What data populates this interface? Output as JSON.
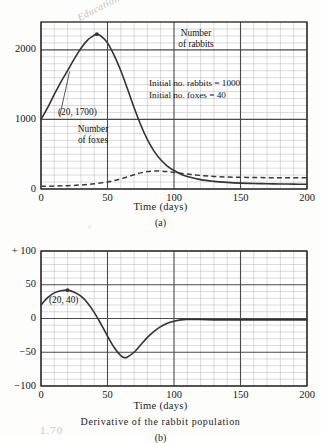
{
  "scan_artifacts": {
    "top_note": "Education",
    "mid_note": "e",
    "bottom_note": "1.70"
  },
  "figures": [
    {
      "id": "figure-a",
      "panel_label": "(a)",
      "caption": "",
      "axis_title": "Time  (days)",
      "annotations": [
        {
          "name": "rabbits-label",
          "text": "Number\nof rabbits"
        },
        {
          "name": "foxes-label",
          "text": "Number\nof foxes"
        },
        {
          "name": "initial-conditions",
          "text": "Initial  no.  rabbits  =  1000\nInitial  no.  foxes  =  40"
        },
        {
          "name": "peak-point-label",
          "text": "(20, 1700)"
        }
      ]
    },
    {
      "id": "figure-b",
      "panel_label": "(b)",
      "caption": "Derivative  of  the  rabbit  population",
      "axis_title": "Time  (days)",
      "annotations": [
        {
          "name": "point-label",
          "text": "(20, 40)"
        }
      ]
    }
  ],
  "chart_data": [
    {
      "type": "line",
      "id": "rabbit-fox-populations",
      "title": "",
      "xlabel": "Time  (days)",
      "ylabel": "",
      "xlim": [
        0,
        200
      ],
      "ylim": [
        0,
        2400
      ],
      "xticks": [
        0,
        50,
        100,
        150,
        200
      ],
      "xtick_labels": [
        "0",
        "50",
        "100",
        "150",
        "200"
      ],
      "yticks": [
        0,
        1000,
        2000
      ],
      "ytick_labels": [
        "0",
        "1000",
        "2000"
      ],
      "grid": "minor 10 days x 100 units, major 50 days x 1000 units",
      "legend": "inline labels",
      "annotations": [
        {
          "text": "(20, 1700)",
          "x": 20,
          "y": 1700
        },
        {
          "text": "Initial no. rabbits = 1000",
          "x": 95,
          "y": 1500
        },
        {
          "text": "Initial no. foxes = 40",
          "x": 95,
          "y": 1350
        }
      ],
      "series": [
        {
          "name": "Number of rabbits",
          "style": "solid",
          "x": [
            0,
            5,
            10,
            15,
            20,
            25,
            30,
            35,
            40,
            42,
            45,
            50,
            55,
            60,
            65,
            70,
            75,
            80,
            85,
            90,
            95,
            100,
            105,
            110,
            120,
            130,
            140,
            150,
            160,
            170,
            180,
            190,
            200
          ],
          "y": [
            1000,
            1170,
            1360,
            1540,
            1700,
            1870,
            2020,
            2140,
            2210,
            2225,
            2200,
            2100,
            1920,
            1700,
            1440,
            1170,
            920,
            710,
            545,
            420,
            330,
            265,
            215,
            180,
            135,
            110,
            95,
            85,
            80,
            75,
            72,
            70,
            68
          ]
        },
        {
          "name": "Number of foxes",
          "style": "dashed",
          "x": [
            0,
            10,
            20,
            30,
            40,
            50,
            55,
            60,
            65,
            70,
            75,
            80,
            85,
            90,
            95,
            100,
            110,
            120,
            130,
            140,
            150,
            160,
            170,
            180,
            190,
            200
          ],
          "y": [
            40,
            42,
            48,
            58,
            75,
            100,
            120,
            145,
            175,
            205,
            232,
            250,
            258,
            258,
            250,
            238,
            215,
            195,
            180,
            172,
            168,
            165,
            163,
            162,
            161,
            160
          ]
        }
      ]
    },
    {
      "type": "line",
      "id": "rabbit-population-derivative",
      "title": "Derivative  of  the  rabbit  population",
      "xlabel": "Time  (days)",
      "ylabel": "",
      "xlim": [
        0,
        200
      ],
      "ylim": [
        -100,
        100
      ],
      "xticks": [
        0,
        50,
        100,
        150,
        200
      ],
      "xtick_labels": [
        "0",
        "50",
        "100",
        "150",
        "200"
      ],
      "yticks": [
        -100,
        -50,
        0,
        50,
        100
      ],
      "ytick_labels": [
        "−100",
        "−50",
        "0",
        "50",
        "+ 100"
      ],
      "grid": "minor 10 days x 10 units, major 50 days x 50 units",
      "annotations": [
        {
          "text": "(20, 40)",
          "x": 20,
          "y": 40
        }
      ],
      "series": [
        {
          "name": "d(rabbits)/dt",
          "style": "solid",
          "x": [
            0,
            5,
            10,
            15,
            20,
            25,
            30,
            35,
            40,
            45,
            50,
            55,
            60,
            63,
            65,
            70,
            75,
            80,
            85,
            90,
            95,
            100,
            105,
            110,
            120,
            130,
            140,
            150,
            160,
            170,
            180,
            190,
            200
          ],
          "y": [
            20,
            31,
            38,
            41,
            42,
            39,
            33,
            23,
            9,
            -8,
            -26,
            -43,
            -55,
            -58,
            -57,
            -50,
            -39,
            -28,
            -19,
            -12,
            -7,
            -4,
            -2,
            -1.5,
            -1.5,
            -2,
            -2,
            -2,
            -2,
            -2,
            -2,
            -2,
            -2
          ]
        }
      ]
    }
  ]
}
